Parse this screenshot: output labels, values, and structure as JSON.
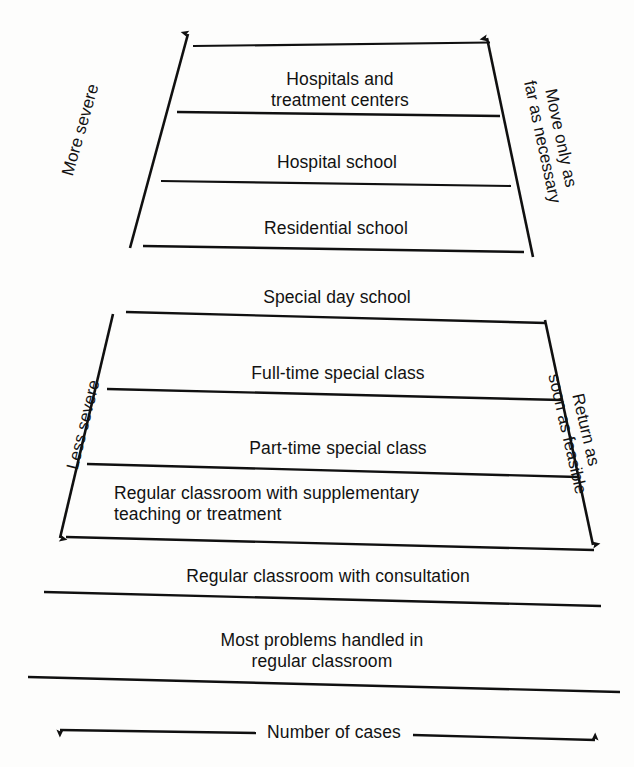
{
  "diagram": {
    "line_color": "#101010",
    "text_color": "#121212",
    "background": "#fdfdfc",
    "axis_labels": {
      "left_top": "More severe",
      "right_top": "Move only as\nfar as necessary",
      "left_bottom": "Less severe",
      "right_bottom": "Return as\nsoon as feasible",
      "bottom": "Number of cases"
    },
    "levels": [
      {
        "id": "hospitals",
        "label": "Hospitals and\ntreatment centers",
        "band": "upper"
      },
      {
        "id": "hospital-school",
        "label": "Hospital school",
        "band": "upper"
      },
      {
        "id": "residential-school",
        "label": "Residential school",
        "band": "upper"
      },
      {
        "id": "special-day-school",
        "label": "Special day school",
        "band": "middle"
      },
      {
        "id": "full-time-special-class",
        "label": "Full-time special class",
        "band": "middle"
      },
      {
        "id": "part-time-special-class",
        "label": "Part-time special class",
        "band": "middle"
      },
      {
        "id": "regular-classroom-supplementary",
        "label": "Regular classroom with supplementary\nteaching or treatment",
        "band": "middle"
      },
      {
        "id": "regular-classroom-consultation",
        "label": "Regular classroom with consultation",
        "band": "lower"
      },
      {
        "id": "most-problems-regular-classroom",
        "label": "Most problems handled in\nregular classroom",
        "band": "lower"
      }
    ]
  }
}
